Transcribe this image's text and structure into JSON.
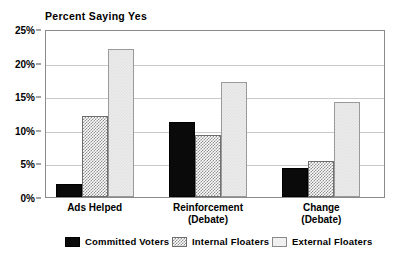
{
  "chart_data": {
    "type": "bar",
    "title": "Percent Saying Yes",
    "xlabel": "",
    "ylabel": "",
    "ylim": [
      0,
      25
    ],
    "ytick_values": [
      0,
      5,
      10,
      15,
      20,
      25
    ],
    "ytick_labels": [
      "0%",
      "5%",
      "10%",
      "15%",
      "20%",
      "25%"
    ],
    "grid": true,
    "legend_position": "bottom",
    "categories": [
      "Ads Helped",
      "Reinforcement (Debate)",
      "Change (Debate)"
    ],
    "category_lines": [
      [
        "Ads Helped"
      ],
      [
        "Reinforcement",
        "(Debate)"
      ],
      [
        "Change",
        "(Debate)"
      ]
    ],
    "series": [
      {
        "name": "Committed Voters",
        "color": "#0a0a0a",
        "pattern": "solid-black",
        "values": [
          2.0,
          11.2,
          4.3
        ]
      },
      {
        "name": "Internal Floaters",
        "color": "#8e8e8e",
        "pattern": "checkerboard-gray",
        "values": [
          12.0,
          9.2,
          5.4
        ]
      },
      {
        "name": "External Floaters",
        "color": "#ececec",
        "pattern": "light-fill",
        "values": [
          22.1,
          17.1,
          14.2
        ]
      }
    ]
  }
}
